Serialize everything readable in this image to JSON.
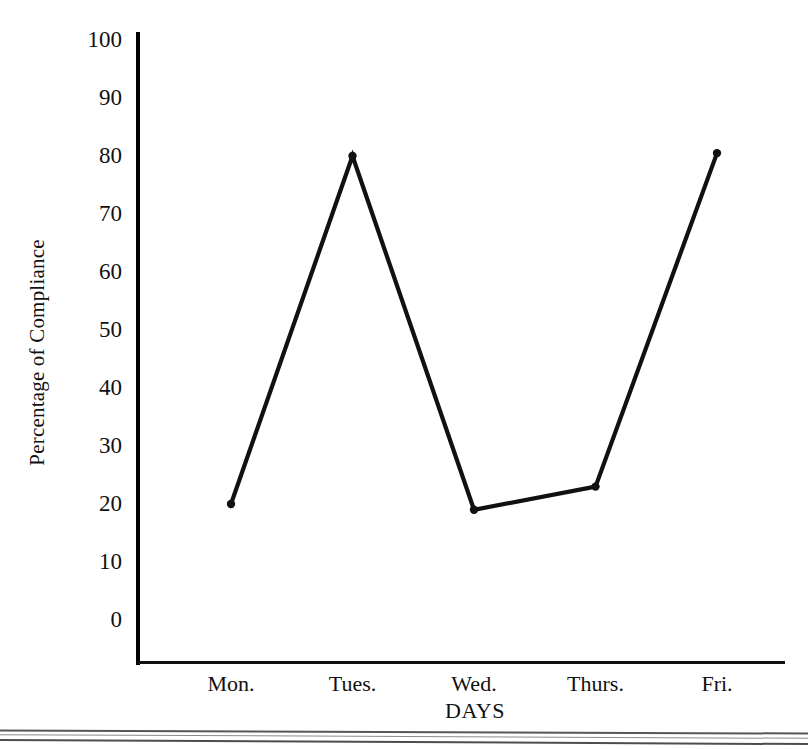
{
  "chart_data": {
    "type": "line",
    "title": "",
    "subtitle": "",
    "xlabel": "DAYS",
    "ylabel": "Percentage of Compliance",
    "categories": [
      "Mon.",
      "Tues.",
      "Wed.",
      "Thurs.",
      "Fri."
    ],
    "values": [
      20,
      80,
      19,
      23,
      80.5
    ],
    "series": [
      {
        "name": "Percentage of Compliance",
        "values": [
          20,
          80,
          19,
          23,
          80.5
        ]
      }
    ],
    "ylim": [
      0,
      100
    ],
    "y_ticks": [
      100,
      90,
      80,
      70,
      60,
      50,
      40,
      30,
      20,
      10,
      0
    ],
    "y_tick_labels": [
      "100",
      "90",
      "80",
      "70",
      "60",
      "50",
      "40",
      "30",
      "20",
      "10",
      "0"
    ],
    "grid": false,
    "legend": false,
    "legend_position": "none",
    "marker": "dot",
    "line_color": "#111111",
    "background_color": "#ffffff"
  },
  "axes": {
    "y_title": "Percentage of Compliance",
    "x_title": "DAYS"
  },
  "colors": {
    "ink": "#111111",
    "background": "#ffffff",
    "scan_rule": "#3a3a3a"
  }
}
